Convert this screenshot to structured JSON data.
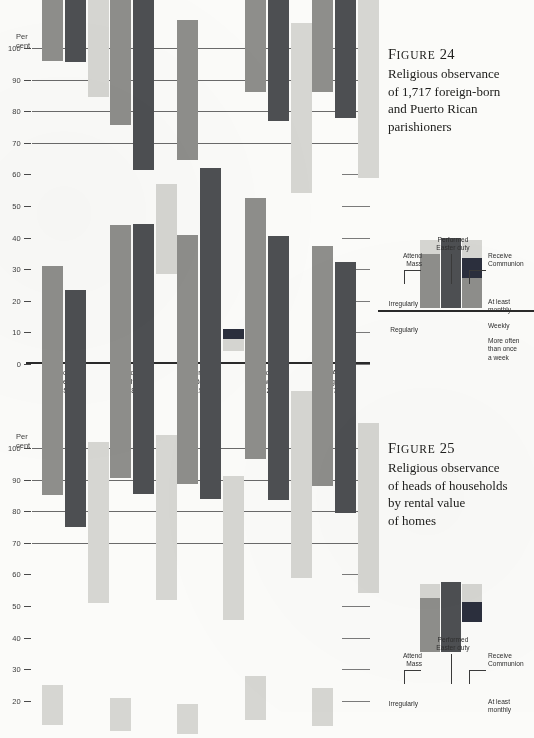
{
  "page": {
    "percent_label_line1": "Per",
    "percent_label_line2": "cent"
  },
  "palette": {
    "irregularly": "#d6d6d2",
    "regularly": "#8e8e8b",
    "easter_duty": "#4d4f52",
    "weekly": "#2b2f3d",
    "paper": "#fbfbf9",
    "ink": "#20201e"
  },
  "legend": {
    "attend_mass_l1": "Attend",
    "attend_mass_l2": "Mass",
    "easter_l1": "Performed",
    "easter_l2": "Easter duty",
    "receive_l1": "Receive",
    "receive_l2": "Communion",
    "irregularly": "Irregularly",
    "regularly": "Regularly",
    "at_least_l1": "At least",
    "at_least_l2": "monthly",
    "weekly": "Weekly",
    "more_often_l1": "More often",
    "more_often_l2": "than once",
    "more_often_l3": "a week"
  },
  "figure24": {
    "number": "F",
    "number_smallcaps": "IGURE",
    "number_value": " 24",
    "title_lines": [
      "Religious observance",
      "of 1,717 foreign-born",
      "and Puerto Rican",
      "parishioners"
    ]
  },
  "figure25": {
    "number": "F",
    "number_smallcaps": "IGURE",
    "number_value": " 25",
    "title_lines": [
      "Religious observance",
      "of heads of households",
      "by rental value",
      "of homes"
    ]
  },
  "chart_data": [
    {
      "type": "bar",
      "id": "figure-24",
      "title": "Religious observance of 1,717 foreign-born and Puerto Rican parishioners",
      "xlabel": "",
      "ylabel": "Per cent",
      "ylim": [
        0,
        100
      ],
      "yticks": [
        0,
        10,
        20,
        30,
        40,
        50,
        60,
        70,
        80,
        90,
        100
      ],
      "ytick_labels": [
        "0",
        "10",
        "20",
        "30",
        "40",
        "50",
        "60",
        "70",
        "80",
        "90",
        "100"
      ],
      "grid": true,
      "legend_position": "right",
      "categories": [
        "Born in Ireland (856)",
        "Born in Italy (381)",
        "Born in Puerto Rico (159)",
        "Born elsewhere (321)",
        "All foreign born (1,717)"
      ],
      "category_label_lines": [
        [
          "Born",
          "in Ireland",
          "(856)"
        ],
        [
          "Born",
          "in Italy",
          "(381)"
        ],
        [
          "Born in",
          "Puerto Rico",
          "(159)"
        ],
        [
          "Born",
          "elsewhere",
          "(321)"
        ],
        [
          "All",
          "foreign born",
          "(1,717)"
        ]
      ],
      "bars": [
        {
          "name": "Attend Mass",
          "stacked": true,
          "segments": [
            {
              "name": "Regularly",
              "color": "#8e8e8b",
              "values": [
                94.0,
                54.5,
                44.5,
                72.5,
                76.0
              ]
            },
            {
              "name": "Irregularly",
              "color": "#d6d6d2",
              "values": [
                2.0,
                21.0,
                20.0,
                13.5,
                10.0
              ]
            }
          ],
          "totals": [
            96.0,
            75.5,
            64.5,
            86.0,
            86.0
          ]
        },
        {
          "name": "Performed Easter duty",
          "stacked": false,
          "segments": [
            {
              "name": "Performed Easter duty",
              "color": "#4d4f52",
              "values": [
                95.5,
                61.5,
                31.0,
                77.0,
                78.0
              ]
            }
          ],
          "totals": [
            95.5,
            61.5,
            31.0,
            77.0,
            78.0
          ]
        },
        {
          "name": "Receive Communion",
          "stacked": true,
          "segments": [
            {
              "name": "More often than once a week",
              "color": "#8e8e8b",
              "values": [
                4.5,
                2.5,
                1.5,
                2.0,
                6.5
              ]
            },
            {
              "name": "Weekly",
              "color": "#2b2f3d",
              "values": [
                2.0,
                5.0,
                3.5,
                10.0,
                6.0
              ]
            },
            {
              "name": "At least monthly",
              "color": "#d6d6d2",
              "values": [
                84.5,
                28.5,
                4.0,
                54.0,
                59.0
              ]
            }
          ],
          "totals": [
            91.0,
            36.0,
            9.0,
            66.0,
            71.5
          ]
        }
      ]
    },
    {
      "type": "bar",
      "id": "figure-25",
      "title": "Religious observance of heads of households by rental value of homes",
      "xlabel": "",
      "ylabel": "Per cent",
      "ylim": [
        0,
        100
      ],
      "yticks": [
        20,
        30,
        40,
        50,
        60,
        70,
        80,
        90,
        100
      ],
      "ytick_labels": [
        "20",
        "30",
        "40",
        "50",
        "60",
        "70",
        "80",
        "90",
        "100"
      ],
      "grid": true,
      "legend_position": "right",
      "note": "Lower portion of this figure is cropped off the bottom of the page",
      "categories": [
        "group-1",
        "group-2",
        "group-3",
        "group-4",
        "group-5"
      ],
      "bars": [
        {
          "name": "Attend Mass",
          "stacked": true,
          "segments": [
            {
              "name": "Regularly",
              "color": "#8e8e8b",
              "values": [
                72.5,
                80.0,
                79.0,
                82.5,
                76.0
              ]
            },
            {
              "name": "Irregularly",
              "color": "#d6d6d2",
              "values": [
                12.5,
                10.5,
                9.5,
                14.0,
                12.0
              ]
            }
          ],
          "totals": [
            85.0,
            90.5,
            88.5,
            96.5,
            88.0
          ]
        },
        {
          "name": "Performed Easter duty",
          "stacked": false,
          "segments": [
            {
              "name": "Performed Easter duty",
              "color": "#4d4f52",
              "values": [
                75.0,
                85.5,
                84.0,
                83.5,
                79.5
              ]
            }
          ],
          "totals": [
            75.0,
            85.5,
            84.0,
            83.5,
            79.5
          ]
        },
        {
          "name": "Receive Communion",
          "stacked": true,
          "segments": [
            {
              "name": "At least monthly",
              "color": "#d6d6d2",
              "values": [
                51.0,
                52.0,
                45.5,
                59.0,
                54.0
              ]
            }
          ],
          "totals": [
            51.0,
            52.0,
            45.5,
            59.0,
            54.0
          ]
        }
      ]
    }
  ]
}
